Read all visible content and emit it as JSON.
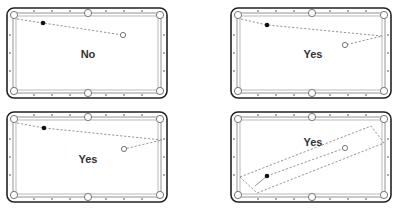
{
  "diagram": {
    "tables": [
      {
        "id": "top-left",
        "label": "No"
      },
      {
        "id": "top-right",
        "label": "Yes"
      },
      {
        "id": "bottom-left",
        "label": "Yes"
      },
      {
        "id": "bottom-right",
        "label": "Yes"
      }
    ],
    "colors": {
      "frame": "#222222",
      "rail": "#888888",
      "shot_line": "#7a7a7a",
      "object_ball": "#111111",
      "cue_ball": "#ffffff"
    }
  }
}
